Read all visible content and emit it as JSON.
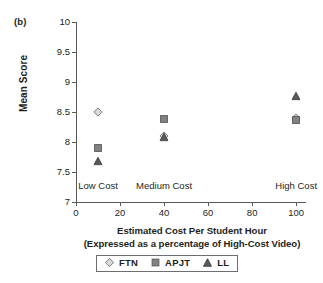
{
  "panel": {
    "letter": "(b)"
  },
  "chart_data": {
    "type": "scatter",
    "title": "",
    "xlabel": "Estimated Cost Per Student Hour",
    "xlabel_line2": "(Expressed as a percentage of High-Cost Video)",
    "ylabel": "Mean Score",
    "xlim": [
      0,
      104
    ],
    "ylim": [
      7,
      10
    ],
    "xticks": [
      0,
      20,
      40,
      60,
      80,
      100
    ],
    "xtick_labels": [
      "0",
      "20",
      "40",
      "60",
      "80",
      "100"
    ],
    "yticks": [
      7,
      7.5,
      8,
      8.5,
      9,
      9.5,
      10
    ],
    "ytick_labels": [
      "7",
      "7.5",
      "8",
      "8.5",
      "9",
      "9.5",
      "10"
    ],
    "grid": false,
    "legend_position": "bottom",
    "x": [
      10,
      40,
      100
    ],
    "categories": [
      "Low Cost",
      "Medium Cost",
      "High Cost"
    ],
    "annotations": [
      {
        "text": "Low Cost",
        "x": 10,
        "y": 7.27
      },
      {
        "text": "Medium Cost",
        "x": 40,
        "y": 7.27
      },
      {
        "text": "High Cost",
        "x": 100,
        "y": 7.27
      }
    ],
    "series": [
      {
        "name": "FTN",
        "marker": "diamond",
        "color": "#d9d9d9",
        "edge_color": "#6d6e71",
        "x": [
          10,
          40,
          100
        ],
        "values": [
          8.5,
          8.1,
          8.4
        ]
      },
      {
        "name": "APJT",
        "marker": "square",
        "color": "#808285",
        "edge_color": "#58595b",
        "x": [
          10,
          40,
          100
        ],
        "values": [
          7.9,
          8.38,
          8.36
        ]
      },
      {
        "name": "LL",
        "marker": "triangle",
        "color": "#58595b",
        "edge_color": "#414042",
        "x": [
          10,
          40,
          100
        ],
        "values": [
          7.69,
          8.09,
          8.77
        ]
      }
    ]
  },
  "legend": {
    "entries": [
      {
        "label": "FTN",
        "marker": "diamond"
      },
      {
        "label": "APJT",
        "marker": "square"
      },
      {
        "label": "LL",
        "marker": "triangle"
      }
    ]
  }
}
